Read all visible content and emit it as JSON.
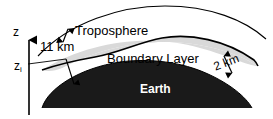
{
  "figure": {
    "kind": "atmosphere-cross-section-diagram",
    "labels": {
      "troposphere": "Troposphere",
      "troposphere_depth": "11 km",
      "boundary_layer": "Boundary Layer",
      "boundary_layer_depth": "2 km",
      "earth": "Earth",
      "axis_z": "z",
      "axis_zi_base": "z",
      "axis_zi_sub": "i"
    },
    "colors": {
      "background": "#ffffff",
      "earth_fill": "#1a1a1a",
      "boundary_layer_fill": "#d9d9d9",
      "troposphere_fill": "#ffffff",
      "outline": "#000000",
      "earth_text": "#ffffff"
    }
  }
}
